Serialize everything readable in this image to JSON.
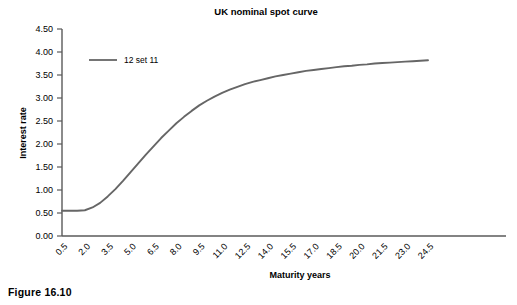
{
  "figure": {
    "caption": "Figure 16.10"
  },
  "chart_data": {
    "type": "line",
    "title": "UK nominal spot curve",
    "xlabel": "Maturity years",
    "ylabel": "Interest rate",
    "xlim": [
      0.5,
      24.5
    ],
    "ylim": [
      0.0,
      4.5
    ],
    "grid": false,
    "legend_position": "inside-top-left",
    "x_tick_labels": [
      "0.5",
      "2.0",
      "3.5",
      "5.0",
      "6.5",
      "8.0",
      "9.5",
      "11.0",
      "12.5",
      "14.0",
      "15.5",
      "17.0",
      "18.5",
      "20.0",
      "21.5",
      "23.0",
      "24.5"
    ],
    "y_tick_labels": [
      "0.00",
      "0.50",
      "1.00",
      "1.50",
      "2.00",
      "2.50",
      "3.00",
      "3.50",
      "4.00",
      "4.50"
    ],
    "x_ticks": [
      0.5,
      2.0,
      3.5,
      5.0,
      6.5,
      8.0,
      9.5,
      11.0,
      12.5,
      14.0,
      15.5,
      17.0,
      18.5,
      20.0,
      21.5,
      23.0,
      24.5
    ],
    "y_ticks": [
      0.0,
      0.5,
      1.0,
      1.5,
      2.0,
      2.5,
      3.0,
      3.5,
      4.0,
      4.5
    ],
    "series": [
      {
        "name": "12 set 11",
        "color": "#666666",
        "x": [
          0.5,
          1.0,
          1.5,
          2.0,
          2.5,
          3.0,
          3.5,
          4.0,
          4.5,
          5.0,
          5.5,
          6.0,
          6.5,
          7.0,
          7.5,
          8.0,
          8.5,
          9.0,
          9.5,
          10.0,
          10.5,
          11.0,
          11.5,
          12.0,
          12.5,
          13.0,
          13.5,
          14.0,
          14.5,
          15.0,
          15.5,
          16.0,
          16.5,
          17.0,
          17.5,
          18.0,
          18.5,
          19.0,
          19.5,
          20.0,
          20.5,
          21.0,
          21.5,
          22.0,
          22.5,
          23.0,
          23.5,
          24.0,
          24.5
        ],
        "values": [
          0.55,
          0.55,
          0.55,
          0.56,
          0.62,
          0.72,
          0.86,
          1.02,
          1.2,
          1.39,
          1.58,
          1.77,
          1.95,
          2.13,
          2.29,
          2.45,
          2.59,
          2.72,
          2.84,
          2.94,
          3.03,
          3.11,
          3.18,
          3.24,
          3.3,
          3.35,
          3.39,
          3.43,
          3.47,
          3.5,
          3.53,
          3.56,
          3.59,
          3.61,
          3.63,
          3.65,
          3.67,
          3.69,
          3.7,
          3.72,
          3.73,
          3.75,
          3.76,
          3.77,
          3.78,
          3.79,
          3.8,
          3.81,
          3.82
        ]
      }
    ]
  }
}
